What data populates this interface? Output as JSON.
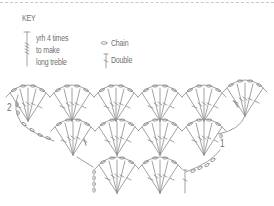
{
  "key": {
    "title": "KEY",
    "items": [
      {
        "symbol": "long-treble-icon",
        "lines": [
          "yrh 4 times",
          "to make",
          "long treble"
        ]
      },
      {
        "symbol": "chain-icon",
        "label": "Chain"
      },
      {
        "symbol": "double-icon",
        "label": "Double"
      }
    ]
  },
  "chart": {
    "row_labels": [
      "1",
      "2"
    ],
    "rows": [
      {
        "row": "2",
        "shells": 6
      },
      {
        "row": "1",
        "shells": 4
      },
      {
        "row": "foundation",
        "shells": 2
      }
    ],
    "colors": {
      "line": "#8a8a8a",
      "text": "#707070",
      "dash": "#c8c8c8"
    }
  }
}
